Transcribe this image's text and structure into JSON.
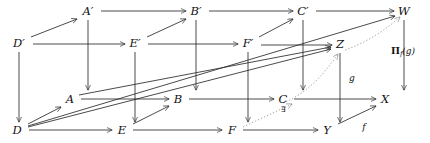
{
  "diagram": {
    "background_color": "#ffffff",
    "stroke_color": "#2b2b2b",
    "dotted_color": "#9a9a9a",
    "width": 430,
    "height": 143,
    "nodes": [
      {
        "id": "Aprime",
        "label": "A′",
        "x": 88,
        "y": 12
      },
      {
        "id": "Bprime",
        "label": "B′",
        "x": 196,
        "y": 12
      },
      {
        "id": "Cprime",
        "label": "C′",
        "x": 303,
        "y": 12
      },
      {
        "id": "W",
        "label": "W",
        "x": 404,
        "y": 12
      },
      {
        "id": "Dprime",
        "label": "D′",
        "x": 19,
        "y": 44
      },
      {
        "id": "Eprime",
        "label": "E′",
        "x": 135,
        "y": 44
      },
      {
        "id": "Fprime",
        "label": "F′",
        "x": 248,
        "y": 44
      },
      {
        "id": "Z",
        "label": "Z",
        "x": 340,
        "y": 45
      },
      {
        "id": "A",
        "label": "A",
        "x": 70,
        "y": 100
      },
      {
        "id": "B",
        "label": "B",
        "x": 178,
        "y": 100
      },
      {
        "id": "C",
        "label": "C",
        "x": 283,
        "y": 100
      },
      {
        "id": "X",
        "label": "X",
        "x": 385,
        "y": 100
      },
      {
        "id": "D",
        "label": "D",
        "x": 17,
        "y": 131
      },
      {
        "id": "E",
        "label": "E",
        "x": 122,
        "y": 131
      },
      {
        "id": "F",
        "label": "F",
        "x": 232,
        "y": 131
      },
      {
        "id": "Y",
        "label": "Y",
        "x": 327,
        "y": 131
      }
    ],
    "edge_labels": [
      {
        "id": "g-label",
        "label": "g",
        "x": 352,
        "y": 78
      },
      {
        "id": "f-label",
        "label": "f",
        "x": 364,
        "y": 127
      }
    ],
    "symbol_labels": [
      {
        "id": "exists-label",
        "label": "∃",
        "x": 283,
        "y": 110
      }
    ],
    "operator_labels": [
      {
        "id": "pi-label",
        "main": "Π",
        "sub": "f",
        "arg": "(g)",
        "x": 403,
        "y": 52
      }
    ],
    "edges": [
      {
        "id": "Aprime-to-Bprime",
        "from": "A′",
        "to": "B′",
        "style": "solid"
      },
      {
        "id": "Bprime-to-Cprime",
        "from": "B′",
        "to": "C′",
        "style": "solid"
      },
      {
        "id": "Cprime-to-W",
        "from": "C′",
        "to": "W",
        "style": "solid"
      },
      {
        "id": "Dprime-to-Eprime",
        "from": "D′",
        "to": "E′",
        "style": "solid"
      },
      {
        "id": "Eprime-to-Fprime",
        "from": "E′",
        "to": "F′",
        "style": "solid"
      },
      {
        "id": "Fprime-to-Z",
        "from": "F′",
        "to": "Z",
        "style": "solid"
      },
      {
        "id": "A-to-B",
        "from": "A",
        "to": "B",
        "style": "solid"
      },
      {
        "id": "B-to-C",
        "from": "B",
        "to": "C",
        "style": "solid"
      },
      {
        "id": "C-to-X",
        "from": "C",
        "to": "X",
        "style": "solid"
      },
      {
        "id": "D-to-E",
        "from": "D",
        "to": "E",
        "style": "solid"
      },
      {
        "id": "E-to-F",
        "from": "E",
        "to": "F",
        "style": "solid"
      },
      {
        "id": "F-to-Y",
        "from": "F",
        "to": "Y",
        "style": "solid"
      },
      {
        "id": "Dprime-to-Aprime",
        "from": "D′",
        "to": "A′",
        "style": "solid"
      },
      {
        "id": "Eprime-to-Bprime",
        "from": "E′",
        "to": "B′",
        "style": "solid"
      },
      {
        "id": "Fprime-to-Cprime",
        "from": "F′",
        "to": "C′",
        "style": "solid"
      },
      {
        "id": "Z-to-W",
        "from": "Z",
        "to": "W",
        "style": "dotted"
      },
      {
        "id": "D-to-A",
        "from": "D",
        "to": "A",
        "style": "solid"
      },
      {
        "id": "E-to-B",
        "from": "E",
        "to": "B",
        "style": "solid"
      },
      {
        "id": "F-to-C",
        "from": "F",
        "to": "C",
        "style": "dotted"
      },
      {
        "id": "Y-to-X",
        "from": "Y",
        "to": "X",
        "style": "solid"
      },
      {
        "id": "Aprime-to-A",
        "from": "A′",
        "to": "A",
        "style": "solid"
      },
      {
        "id": "Bprime-to-B",
        "from": "B′",
        "to": "B",
        "style": "solid"
      },
      {
        "id": "Cprime-to-C",
        "from": "C′",
        "to": "C",
        "style": "solid"
      },
      {
        "id": "W-to-X",
        "from": "W",
        "to": "X",
        "style": "solid"
      },
      {
        "id": "Dprime-to-D",
        "from": "D′",
        "to": "D",
        "style": "solid"
      },
      {
        "id": "Eprime-to-E",
        "from": "E′",
        "to": "E",
        "style": "solid"
      },
      {
        "id": "Fprime-to-F",
        "from": "F′",
        "to": "F",
        "style": "solid"
      },
      {
        "id": "Z-to-Y",
        "from": "Z",
        "to": "Y",
        "style": "solid"
      },
      {
        "id": "A-to-Z",
        "from": "A",
        "to": "Z",
        "style": "solid"
      },
      {
        "id": "D-to-Z",
        "from": "D",
        "to": "Z",
        "style": "solid"
      },
      {
        "id": "D-to-W",
        "from": "D",
        "to": "W",
        "style": "solid"
      },
      {
        "id": "X-to-Z-curve",
        "from": "X",
        "to": "Z",
        "style": "dotted"
      }
    ]
  }
}
